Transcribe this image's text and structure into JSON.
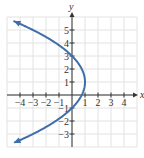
{
  "chart_data": {
    "type": "line",
    "title": "",
    "xlabel": "x",
    "ylabel": "y",
    "xlim": [
      -5,
      5
    ],
    "ylim": [
      -4,
      6
    ],
    "grid": true,
    "x_ticks": [
      -4,
      -3,
      -2,
      -1,
      1,
      2,
      3,
      4
    ],
    "y_ticks": [
      -3,
      -2,
      -1,
      1,
      2,
      3,
      4,
      5
    ],
    "x_tick_labels": [
      "−4",
      "−3",
      "−2",
      "−1",
      "1",
      "2",
      "3",
      "4"
    ],
    "y_tick_labels": [
      "−3",
      "−2",
      "−1",
      "1",
      "2",
      "3",
      "4",
      "5"
    ],
    "series": [
      {
        "name": "x = 1 - (y - 1)^2 / 4",
        "equation": "x = -(1/4)(y - 1)^2 + 1",
        "vertex": [
          1,
          1
        ],
        "points": [
          [
            -4.5,
            5.69
          ],
          [
            -3,
            5
          ],
          [
            -1.25,
            4
          ],
          [
            0,
            3
          ],
          [
            0.75,
            2
          ],
          [
            1,
            1
          ],
          [
            0.75,
            0
          ],
          [
            0,
            -1
          ],
          [
            -1.25,
            -2
          ],
          [
            -3,
            -3
          ],
          [
            -4.5,
            -3.69
          ]
        ],
        "arrows": "both ends",
        "color": "#3f6ea8"
      }
    ]
  },
  "colors": {
    "curve": "#3f6ea8",
    "grid": "#e2e2e2",
    "axis": "#333333"
  }
}
